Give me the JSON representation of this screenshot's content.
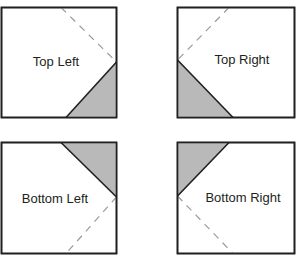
{
  "diagram": {
    "type": "corner-triangle-orientation-guide",
    "colors": {
      "background": "#ffffff",
      "border": "#231f20",
      "fill_shaded": "#b9b9b9",
      "dashed_line": "#9a9a9a",
      "text": "#231f20"
    },
    "panels": [
      {
        "id": "top-left",
        "label": "Top Left",
        "square": {
          "x": 1.5,
          "y": 7.5,
          "w": 115,
          "h": 110
        },
        "shaded_triangle": "116.5,62 116.5,117.5 66,117.5",
        "solid_line": {
          "x1": 116.5,
          "y1": 62,
          "x2": 66,
          "y2": 117.5
        },
        "dashed_line": {
          "x1": 61,
          "y1": 7.5,
          "x2": 116.5,
          "y2": 62
        },
        "label_pos": {
          "x": 56,
          "y": 66
        }
      },
      {
        "id": "top-right",
        "label": "Top Right",
        "square": {
          "x": 177.5,
          "y": 7.5,
          "w": 117,
          "h": 110
        },
        "shaded_triangle": "177.5,60 177.5,117.5 233,117.5",
        "solid_line": {
          "x1": 177.5,
          "y1": 60,
          "x2": 233,
          "y2": 117.5
        },
        "dashed_line": {
          "x1": 229,
          "y1": 7.5,
          "x2": 177.5,
          "y2": 60
        },
        "label_pos": {
          "x": 242,
          "y": 64
        }
      },
      {
        "id": "bottom-left",
        "label": "Bottom Left",
        "square": {
          "x": 1.5,
          "y": 142.5,
          "w": 115,
          "h": 111
        },
        "shaded_triangle": "61,142.5 116.5,142.5 116.5,197",
        "solid_line": {
          "x1": 61,
          "y1": 142.5,
          "x2": 116.5,
          "y2": 197
        },
        "dashed_line": {
          "x1": 116.5,
          "y1": 197,
          "x2": 66,
          "y2": 253.5
        },
        "label_pos": {
          "x": 55,
          "y": 203
        }
      },
      {
        "id": "bottom-right",
        "label": "Bottom Right",
        "square": {
          "x": 177.5,
          "y": 142.5,
          "w": 117,
          "h": 111
        },
        "shaded_triangle": "177.5,142.5 229,142.5 177.5,196",
        "solid_line": {
          "x1": 229,
          "y1": 142.5,
          "x2": 177.5,
          "y2": 196
        },
        "dashed_line": {
          "x1": 177.5,
          "y1": 196,
          "x2": 233,
          "y2": 253.5
        },
        "label_pos": {
          "x": 243,
          "y": 202
        }
      }
    ]
  }
}
